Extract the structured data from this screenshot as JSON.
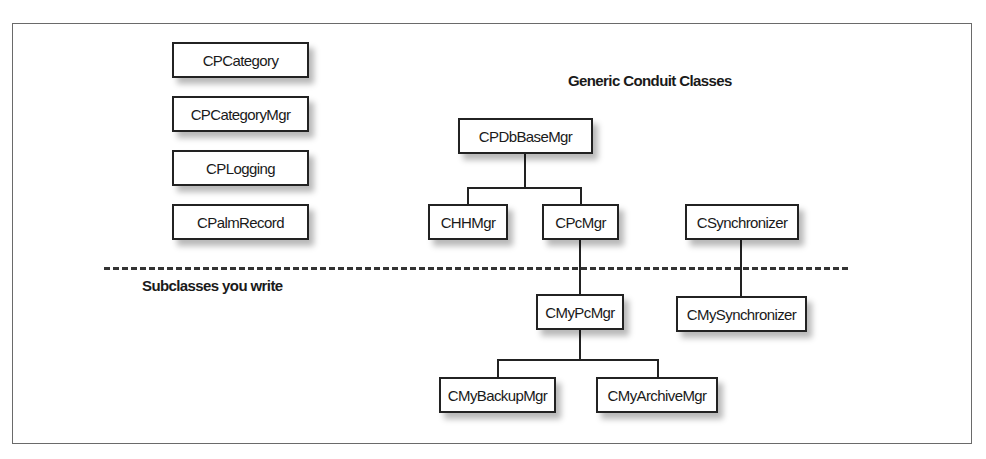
{
  "diagram": {
    "standalone_classes": [
      "CPCategory",
      "CPCategoryMgr",
      "CPLogging",
      "CPalmRecord"
    ],
    "generic_section_title": "Generic Conduit Classes",
    "subclass_section_title": "Subclasses you write",
    "generic_classes": {
      "base": "CPDbBaseMgr",
      "hh_mgr": "CHHMgr",
      "pc_mgr": "CPcMgr",
      "synchronizer": "CSynchronizer"
    },
    "user_subclasses": {
      "my_pc_mgr": "CMyPcMgr",
      "my_synchronizer": "CMySynchronizer",
      "my_backup_mgr": "CMyBackupMgr",
      "my_archive_mgr": "CMyArchiveMgr"
    },
    "relationships": [
      {
        "parent": "CPDbBaseMgr",
        "child": "CHHMgr"
      },
      {
        "parent": "CPDbBaseMgr",
        "child": "CPcMgr"
      },
      {
        "parent": "CPcMgr",
        "child": "CMyPcMgr"
      },
      {
        "parent": "CSynchronizer",
        "child": "CMySynchronizer"
      },
      {
        "parent": "CMyPcMgr",
        "child": "CMyBackupMgr"
      },
      {
        "parent": "CMyPcMgr",
        "child": "CMyArchiveMgr"
      }
    ]
  }
}
